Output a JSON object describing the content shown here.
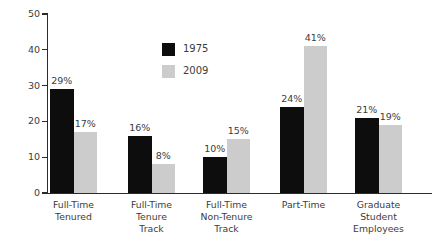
{
  "chart_data": {
    "type": "bar",
    "title": "",
    "subtitle": "",
    "xlabel": "",
    "ylabel": "",
    "ylim": [
      0,
      50
    ],
    "yticks": [
      0,
      10,
      20,
      30,
      40,
      50
    ],
    "ytick_labels": [
      "0",
      "10",
      "20",
      "30",
      "40",
      "50"
    ],
    "grid": false,
    "legend_position": "inside-top-center",
    "categories": [
      "Full-Time\nTenured",
      "Full-Time\nTenure\nTrack",
      "Full-Time\nNon-Tenure\nTrack",
      "Part-Time",
      "Graduate\nStudent\nEmployees"
    ],
    "series": [
      {
        "name": "1975",
        "color": "#0d0d0d",
        "values": [
          29,
          16,
          10,
          24,
          21
        ],
        "data_labels": [
          "29%",
          "16%",
          "10%",
          "24%",
          "21%"
        ]
      },
      {
        "name": "2009",
        "color": "#cccccc",
        "values": [
          17,
          8,
          15,
          41,
          19
        ],
        "data_labels": [
          "17%",
          "8%",
          "15%",
          "41%",
          "19%"
        ]
      }
    ]
  },
  "legend": {
    "items": [
      {
        "label": "1975",
        "color": "#0d0d0d"
      },
      {
        "label": "2009",
        "color": "#cccccc"
      }
    ]
  },
  "colors": {
    "series_1975": "#0d0d0d",
    "series_2009": "#cccccc",
    "axis": "#2b2b2b",
    "text": "#3c3c3c",
    "background": "#ffffff"
  }
}
